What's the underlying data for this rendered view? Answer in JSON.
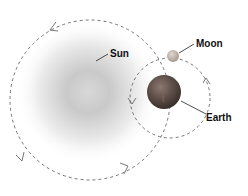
{
  "labels": {
    "sun": "Sun",
    "moon": "Moon",
    "earth": "Earth"
  },
  "bodies": [
    {
      "name": "Sun",
      "color": "#bdbdbd"
    },
    {
      "name": "Earth",
      "color": "#5a4a44"
    },
    {
      "name": "Moon",
      "color": "#b8b0a8"
    }
  ],
  "orbits": [
    {
      "name": "earth-orbit-around-sun",
      "style": "dashed",
      "direction": "counter-clockwise"
    },
    {
      "name": "moon-orbit-around-earth",
      "style": "dashed",
      "direction": "counter-clockwise"
    }
  ]
}
